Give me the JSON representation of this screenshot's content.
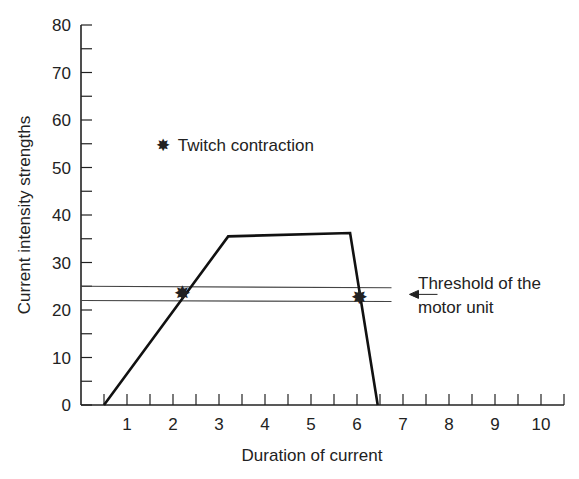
{
  "chart_data": {
    "type": "line",
    "title": "",
    "xlabel": "Duration of current",
    "ylabel": "Current intensity strengths",
    "xlim": [
      0,
      10.5
    ],
    "ylim": [
      0,
      80
    ],
    "x_ticks_major": [
      1,
      2,
      3,
      4,
      5,
      6,
      7,
      8,
      9,
      10
    ],
    "x_tick_labels": [
      "1",
      "2",
      "3",
      "4",
      "5",
      "6",
      "7",
      "8",
      "9",
      "10"
    ],
    "x_minor_step": 0.5,
    "y_ticks_major": [
      0,
      10,
      20,
      30,
      40,
      50,
      60,
      70,
      80
    ],
    "y_tick_labels": [
      "0",
      "10",
      "20",
      "30",
      "40",
      "50",
      "60",
      "70",
      "80"
    ],
    "y_minor_step": 5,
    "grid": false,
    "series": [
      {
        "name": "Stimulus curve",
        "x": [
          0.5,
          3.2,
          5.85,
          6.45
        ],
        "y": [
          0,
          35.5,
          36.2,
          0
        ],
        "color": "#111111"
      }
    ],
    "threshold_band": {
      "label_line1": "Threshold of the",
      "label_line2": "motor unit",
      "upper": 25,
      "lower": 22,
      "x_end": 6.75,
      "color": "#444444"
    },
    "markers": {
      "symbol": "✸",
      "legend_label": "Twitch contraction",
      "legend_position": {
        "x": 1.8,
        "y": 55
      },
      "points": [
        {
          "x": 2.2,
          "y": 23.5
        },
        {
          "x": 6.05,
          "y": 22.8
        }
      ]
    }
  }
}
